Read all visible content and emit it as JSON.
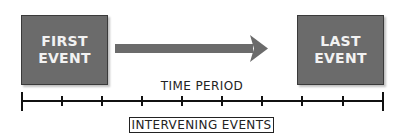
{
  "diagram": {
    "first_event": {
      "line1": "FIRST",
      "line2": "EVENT"
    },
    "last_event": {
      "line1": "LAST",
      "line2": "EVENT"
    },
    "arrow": {
      "direction": "right",
      "color": "#6b6b6b"
    },
    "timeline": {
      "label": "TIME PERIOD",
      "tick_count": 10,
      "bracket_label": "INTERVENING EVENTS"
    },
    "colors": {
      "box_fill": "#6b6b6b",
      "box_text": "#f2f2f2",
      "line": "#222222"
    }
  }
}
